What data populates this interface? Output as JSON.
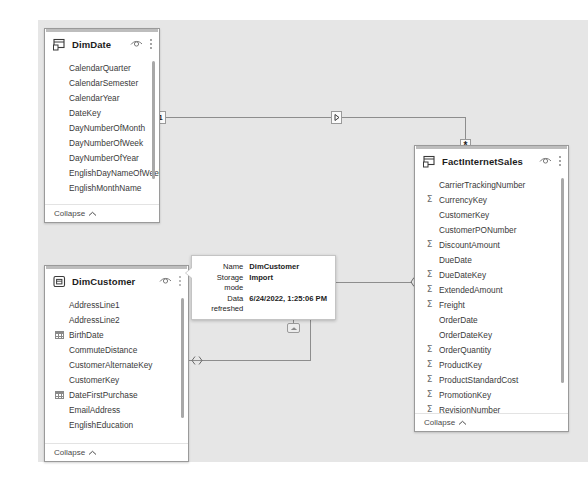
{
  "canvas": {
    "background": "#e6e6e6"
  },
  "tables": [
    {
      "name": "DimDate",
      "icon": "table-date-icon",
      "hide_icon": "eye-icon",
      "menu_icon": "more-options-icon",
      "collapse_label": "Collapse",
      "collapse_icon": "chevron-up-icon",
      "fields": [
        {
          "name": "CalendarQuarter",
          "glyph": ""
        },
        {
          "name": "CalendarSemester",
          "glyph": ""
        },
        {
          "name": "CalendarYear",
          "glyph": ""
        },
        {
          "name": "DateKey",
          "glyph": ""
        },
        {
          "name": "DayNumberOfMonth",
          "glyph": ""
        },
        {
          "name": "DayNumberOfWeek",
          "glyph": ""
        },
        {
          "name": "DayNumberOfYear",
          "glyph": ""
        },
        {
          "name": "EnglishDayNameOfWeek",
          "glyph": ""
        },
        {
          "name": "EnglishMonthName",
          "glyph": ""
        }
      ]
    },
    {
      "name": "DimCustomer",
      "icon": "table-customer-icon",
      "hide_icon": "eye-icon",
      "menu_icon": "more-options-icon",
      "collapse_label": "Collapse",
      "collapse_icon": "chevron-up-icon",
      "fields": [
        {
          "name": "AddressLine1",
          "glyph": ""
        },
        {
          "name": "AddressLine2",
          "glyph": ""
        },
        {
          "name": "BirthDate",
          "glyph": "calendar"
        },
        {
          "name": "CommuteDistance",
          "glyph": ""
        },
        {
          "name": "CustomerAlternateKey",
          "glyph": ""
        },
        {
          "name": "CustomerKey",
          "glyph": ""
        },
        {
          "name": "DateFirstPurchase",
          "glyph": "calendar"
        },
        {
          "name": "EmailAddress",
          "glyph": ""
        },
        {
          "name": "EnglishEducation",
          "glyph": ""
        }
      ]
    },
    {
      "name": "FactInternetSales",
      "icon": "table-fact-icon",
      "hide_icon": "eye-icon",
      "menu_icon": "more-options-icon",
      "collapse_label": "Collapse",
      "collapse_icon": "chevron-up-icon",
      "fields": [
        {
          "name": "CarrierTrackingNumber",
          "glyph": ""
        },
        {
          "name": "CurrencyKey",
          "glyph": "sigma"
        },
        {
          "name": "CustomerKey",
          "glyph": ""
        },
        {
          "name": "CustomerPONumber",
          "glyph": ""
        },
        {
          "name": "DiscountAmount",
          "glyph": "sigma"
        },
        {
          "name": "DueDate",
          "glyph": ""
        },
        {
          "name": "DueDateKey",
          "glyph": "sigma"
        },
        {
          "name": "ExtendedAmount",
          "glyph": "sigma"
        },
        {
          "name": "Freight",
          "glyph": "sigma"
        },
        {
          "name": "OrderDate",
          "glyph": ""
        },
        {
          "name": "OrderDateKey",
          "glyph": ""
        },
        {
          "name": "OrderQuantity",
          "glyph": "sigma"
        },
        {
          "name": "ProductKey",
          "glyph": "sigma"
        },
        {
          "name": "ProductStandardCost",
          "glyph": "sigma"
        },
        {
          "name": "PromotionKey",
          "glyph": "sigma"
        },
        {
          "name": "RevisionNumber",
          "glyph": "sigma"
        }
      ]
    }
  ],
  "relationships": [
    {
      "from": "DimDate",
      "to": "FactInternetSales",
      "from_cardinality": "1",
      "to_cardinality": "*"
    },
    {
      "from": "DimCustomer",
      "to": "FactInternetSales",
      "from_cardinality": "1",
      "to_cardinality": "*"
    }
  ],
  "tooltip": {
    "rows": [
      {
        "key": "Name",
        "value": "DimCustomer"
      },
      {
        "key": "Storage mode",
        "value": "Import"
      },
      {
        "key": "Data refreshed",
        "value": "6/24/2022, 1:25:06 PM"
      }
    ]
  }
}
